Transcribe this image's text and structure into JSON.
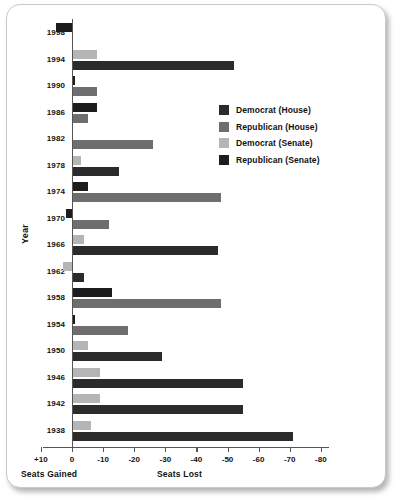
{
  "chart_data": {
    "type": "bar",
    "orientation": "horizontal",
    "title": "",
    "xlabel": "Seats Lost",
    "xlabel_left": "Seats Gained",
    "ylabel": "Year",
    "xlim": [
      10,
      -80
    ],
    "xticks": [
      "+10",
      "0",
      "-10",
      "-20",
      "-30",
      "-40",
      "-50",
      "-60",
      "-70",
      "-80"
    ],
    "xtick_values": [
      10,
      0,
      -10,
      -20,
      -30,
      -40,
      -50,
      -60,
      -70,
      -80
    ],
    "grid": false,
    "legend_position": "middle-right",
    "categories": [
      "1998",
      "1994",
      "1990",
      "1986",
      "1982",
      "1978",
      "1974",
      "1970",
      "1966",
      "1962",
      "1958",
      "1954",
      "1950",
      "1946",
      "1942",
      "1938"
    ],
    "series": [
      {
        "name": "Democrat (House)",
        "key": "dem_house",
        "color": "#2b2b2b",
        "values": [
          null,
          -52,
          null,
          null,
          null,
          -15,
          null,
          null,
          -47,
          -4,
          null,
          null,
          -29,
          -55,
          -55,
          -71
        ]
      },
      {
        "name": "Republican (House)",
        "key": "rep_house",
        "color": "#6e6e6e",
        "values": [
          null,
          null,
          -8,
          -5,
          -26,
          null,
          -48,
          -12,
          null,
          null,
          -48,
          -18,
          null,
          null,
          null,
          null
        ]
      },
      {
        "name": "Democrat (Senate)",
        "key": "dem_senate",
        "color": "#b5b5b5",
        "values": [
          -5,
          -8,
          null,
          null,
          null,
          -3,
          null,
          null,
          -4,
          3,
          null,
          null,
          -5,
          -9,
          -9,
          -6
        ]
      },
      {
        "name": "Republican (Senate)",
        "key": "rep_senate",
        "color": "#1c1c1c",
        "values": [
          5,
          null,
          -1,
          -8,
          0.4,
          null,
          -5,
          2,
          null,
          null,
          -13,
          -1,
          null,
          null,
          null,
          null
        ]
      }
    ],
    "rows": [
      {
        "year": "1998",
        "senate": {
          "series": "rep_senate",
          "value": 5
        },
        "house": {
          "series": null,
          "value": null
        }
      },
      {
        "year": "1994",
        "senate": {
          "series": "dem_senate",
          "value": -8
        },
        "house": {
          "series": "dem_house",
          "value": -52
        }
      },
      {
        "year": "1990",
        "senate": {
          "series": "rep_senate",
          "value": -1
        },
        "house": {
          "series": "rep_house",
          "value": -8
        }
      },
      {
        "year": "1986",
        "senate": {
          "series": "rep_senate",
          "value": -8
        },
        "house": {
          "series": "rep_house",
          "value": -5
        }
      },
      {
        "year": "1982",
        "senate": {
          "series": "rep_senate",
          "value": -0.4
        },
        "house": {
          "series": "rep_house",
          "value": -26
        }
      },
      {
        "year": "1978",
        "senate": {
          "series": "dem_senate",
          "value": -3
        },
        "house": {
          "series": "dem_house",
          "value": -15
        }
      },
      {
        "year": "1974",
        "senate": {
          "series": "rep_senate",
          "value": -5
        },
        "house": {
          "series": "rep_house",
          "value": -48
        }
      },
      {
        "year": "1970",
        "senate": {
          "series": "rep_senate",
          "value": 2
        },
        "house": {
          "series": "rep_house",
          "value": -12
        }
      },
      {
        "year": "1966",
        "senate": {
          "series": "dem_senate",
          "value": -4
        },
        "house": {
          "series": "dem_house",
          "value": -47
        }
      },
      {
        "year": "1962",
        "senate": {
          "series": "dem_senate",
          "value": 3
        },
        "house": {
          "series": "dem_house",
          "value": -4
        }
      },
      {
        "year": "1958",
        "senate": {
          "series": "rep_senate",
          "value": -13
        },
        "house": {
          "series": "rep_house",
          "value": -48
        }
      },
      {
        "year": "1954",
        "senate": {
          "series": "rep_senate",
          "value": -1
        },
        "house": {
          "series": "rep_house",
          "value": -18
        }
      },
      {
        "year": "1950",
        "senate": {
          "series": "dem_senate",
          "value": -5
        },
        "house": {
          "series": "dem_house",
          "value": -29
        }
      },
      {
        "year": "1946",
        "senate": {
          "series": "dem_senate",
          "value": -9
        },
        "house": {
          "series": "dem_house",
          "value": -55
        }
      },
      {
        "year": "1942",
        "senate": {
          "series": "dem_senate",
          "value": -9
        },
        "house": {
          "series": "dem_house",
          "value": -55
        }
      },
      {
        "year": "1938",
        "senate": {
          "series": "dem_senate",
          "value": -6
        },
        "house": {
          "series": "dem_house",
          "value": -71
        }
      }
    ]
  },
  "legend": {
    "items": [
      {
        "label": "Democrat (House)",
        "color": "#2b2b2b"
      },
      {
        "label": "Republican (House)",
        "color": "#6e6e6e"
      },
      {
        "label": "Democrat (Senate)",
        "color": "#b5b5b5"
      },
      {
        "label": "Republican (Senate)",
        "color": "#1c1c1c"
      }
    ]
  },
  "axes": {
    "y_title": "Year",
    "x_title_left": "Seats Gained",
    "x_title_right": "Seats Lost"
  }
}
